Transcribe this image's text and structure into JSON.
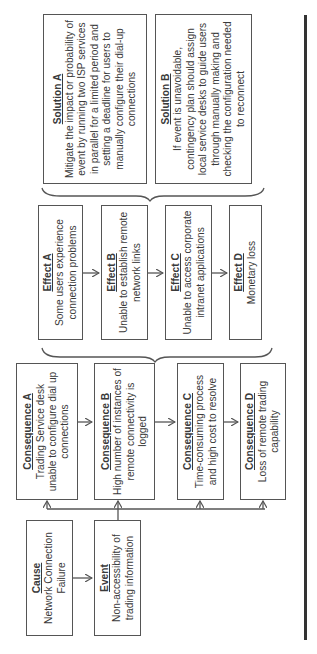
{
  "diagram": {
    "cause": {
      "title": "Cause",
      "text": "Network Connection Failure"
    },
    "event": {
      "title": "Event",
      "text": "Non-accessibility of trading information"
    },
    "consequences": [
      {
        "title": "Consequence A",
        "text": "Trading Service desk unable to configure dial up connections"
      },
      {
        "title": "Consequence B",
        "text": "High number of instances of remote connectivity is logged"
      },
      {
        "title": "Consequence C",
        "text": "Time-consuming process and high cost to resolve"
      },
      {
        "title": "Consequence D",
        "text": "Loss of remote trading capability"
      }
    ],
    "effects": [
      {
        "title": "Effect A",
        "text": "Some users experience connection problems"
      },
      {
        "title": "Effect B",
        "text": "Unable to establish remote network links"
      },
      {
        "title": "Effect C",
        "text": "Unable to access corporate intranet applications"
      },
      {
        "title": "Effect D",
        "text": "Monetary loss"
      }
    ],
    "solutions": [
      {
        "title": "Solution A",
        "text": "Mitigate the impact or probability of event by running two ISP services in parallel for a limited period and setting a deadline for users to manually configure their dial-up connections"
      },
      {
        "title": "Solution B",
        "text": "If event is unavoidable, contingency plan should assign local service desks to guide users through manually making and checking the configuration needed to reconnect"
      }
    ],
    "orientation": "rotated 90 degrees counterclockwise",
    "colors": {
      "line": "#555555",
      "text": "#3a3a3a",
      "rule": "#333333"
    }
  }
}
